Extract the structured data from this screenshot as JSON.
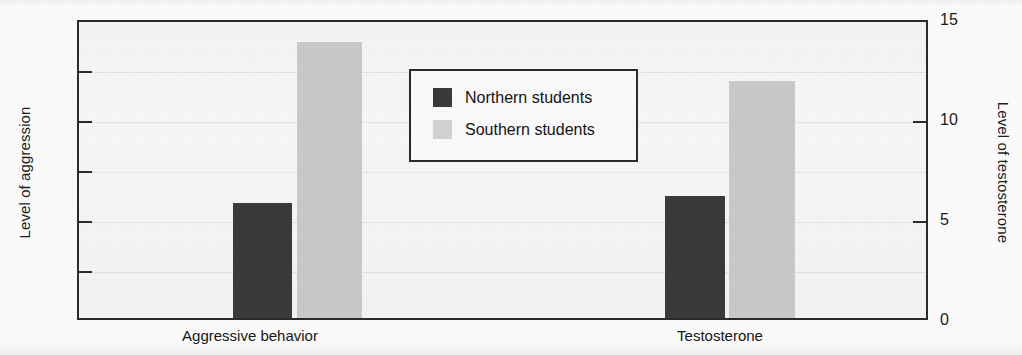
{
  "chart_data": {
    "type": "bar",
    "title": "",
    "subtitle": "",
    "categories": [
      "Aggressive behavior",
      "Testosterone"
    ],
    "series": [
      {
        "name": "Northern students",
        "color": "#3a3a3a",
        "values": [
          35,
          37
        ]
      },
      {
        "name": "Southern students",
        "color": "#c9c9c9",
        "values": [
          84,
          72
        ]
      }
    ],
    "legend": {
      "position": "inside-center",
      "entries": [
        {
          "label": "Northern students",
          "color": "#3a3a3a"
        },
        {
          "label": "Southern students",
          "color": "#d2d2d2"
        }
      ]
    },
    "axes": {
      "x": {
        "label": "",
        "tick_labels": [
          "Aggressive behavior",
          "Testosterone"
        ]
      },
      "y_left": {
        "label": "Level of aggression",
        "ticks": [
          0,
          15,
          30,
          45,
          60,
          75,
          90
        ],
        "tick_labels": [
          "0",
          "15",
          "30",
          "45",
          "60",
          "75",
          "90"
        ],
        "ylim": [
          0,
          90
        ]
      },
      "y_right": {
        "label": "Level of testosterone",
        "ticks": [
          0,
          5,
          10,
          15
        ],
        "tick_labels": [
          "0",
          "5",
          "10",
          "15"
        ],
        "ylim": [
          0,
          15
        ]
      }
    },
    "grid": true
  },
  "colors": {
    "northern": "#3a3a3a",
    "southern": "#c9c9c9",
    "frame": "#2b2b2b",
    "plot_background": "#f7f7f7",
    "page_background": "#fbfbfb"
  }
}
